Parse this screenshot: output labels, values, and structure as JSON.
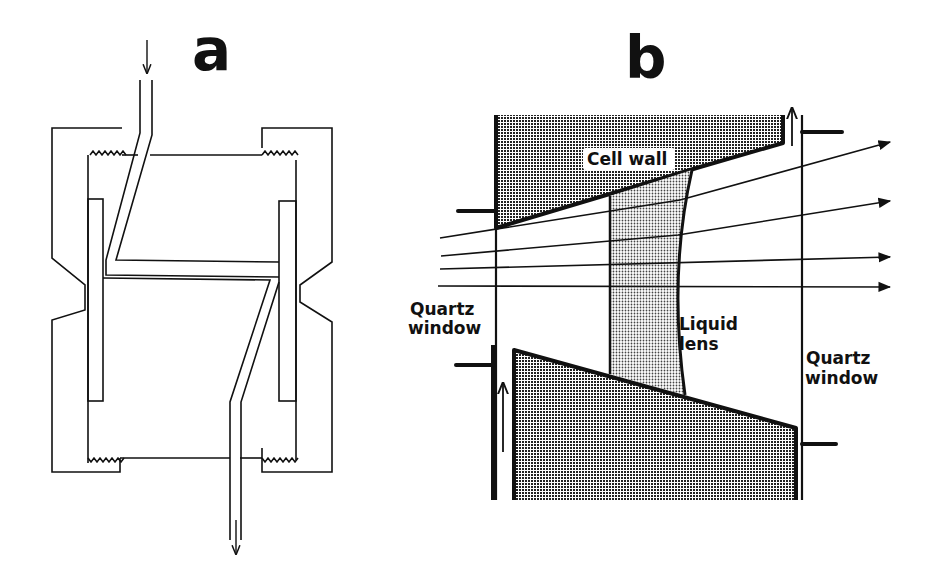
{
  "figure": {
    "panels": [
      {
        "id": "a",
        "letter": "a",
        "description": "Flow cell cross-section with threaded end caps, two windows, and a zig-zag inlet/outlet channel",
        "flow_in_arrow": "down",
        "flow_out_arrow": "down"
      },
      {
        "id": "b",
        "letter": "b",
        "labels": {
          "cell_wall": "Cell wall",
          "liquid_lens": [
            "Liquid",
            "lens"
          ],
          "quartz_window_left": [
            "Quartz",
            "window"
          ],
          "quartz_window_right": [
            "Quartz",
            "window"
          ]
        },
        "light_rays": 5,
        "flow_arrows": [
          "up-right-top",
          "up-left-bottom"
        ]
      }
    ],
    "colors": {
      "ink": "#111111",
      "background": "#ffffff",
      "wall_fill": "#555555",
      "lens_fill": "#bbbbbb"
    }
  }
}
